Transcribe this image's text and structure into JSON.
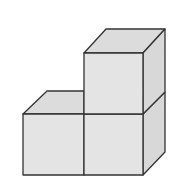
{
  "diagram": {
    "cube_count": 3,
    "colors": {
      "face_fill": "#e4e4e4",
      "top_fill": "#dcdcdc",
      "side_fill": "#d8d8d8",
      "stroke": "#333333",
      "background": "#ffffff"
    }
  }
}
